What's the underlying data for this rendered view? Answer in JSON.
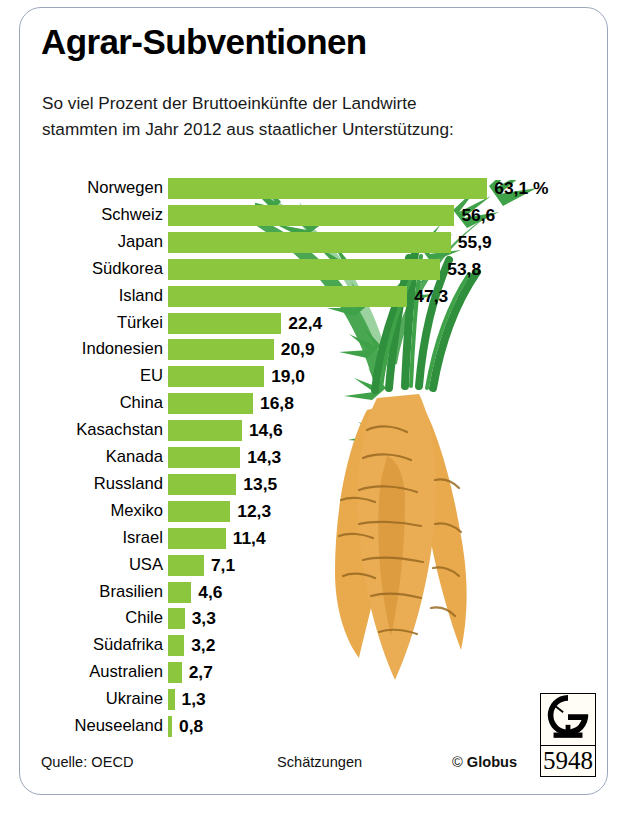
{
  "header": {
    "title": "Agrar-Subventionen",
    "subtitle_line1": "So viel Prozent der Bruttoeinkünfte der Landwirte",
    "subtitle_line2": "stammten im Jahr 2012 aus staatlicher Unterstützung:"
  },
  "footer": {
    "source": "Quelle: OECD",
    "note": "Schätzungen",
    "copyright_mark": "©",
    "copyright_name": "Globus",
    "logo_letter": "G",
    "logo_number": "5948"
  },
  "colors": {
    "bar_green": "#8cc63f",
    "leaf_green": "#3fa148",
    "carrot_orange": "#e9a94d",
    "carrot_shadow": "#d79336",
    "carrot_line": "#9a6a22",
    "frame_border": "#9aa7bb",
    "text": "#000000"
  },
  "chart_data": {
    "type": "bar",
    "orientation": "horizontal",
    "title": "Agrar-Subventionen",
    "subtitle": "So viel Prozent der Bruttoeinkünfte der Landwirte stammten im Jahr 2012 aus staatlicher Unterstützung:",
    "xlabel": "",
    "ylabel": "",
    "unit": "%",
    "unit_suffix_on_first": "63,1 %",
    "xlim": [
      0,
      63.1
    ],
    "grid": false,
    "legend": false,
    "source": "Quelle: OECD",
    "note": "Schätzungen",
    "categories": [
      "Norwegen",
      "Schweiz",
      "Japan",
      "Südkorea",
      "Island",
      "Türkei",
      "Indonesien",
      "EU",
      "China",
      "Kasachstan",
      "Kanada",
      "Russland",
      "Mexiko",
      "Israel",
      "USA",
      "Brasilien",
      "Chile",
      "Südafrika",
      "Australien",
      "Ukraine",
      "Neuseeland"
    ],
    "values": [
      63.1,
      56.6,
      55.9,
      53.8,
      47.3,
      22.4,
      20.9,
      19.0,
      16.8,
      14.6,
      14.3,
      13.5,
      12.3,
      11.4,
      7.1,
      4.6,
      3.3,
      3.2,
      2.7,
      1.3,
      0.8
    ],
    "value_labels": [
      "63,1 %",
      "56,6",
      "55,9",
      "53,8",
      "47,3",
      "22,4",
      "20,9",
      "19,0",
      "16,8",
      "14,6",
      "14,3",
      "13,5",
      "12,3",
      "11,4",
      "7,1",
      "4,6",
      "3,3",
      "3,2",
      "2,7",
      "1,3",
      "0,8"
    ]
  }
}
